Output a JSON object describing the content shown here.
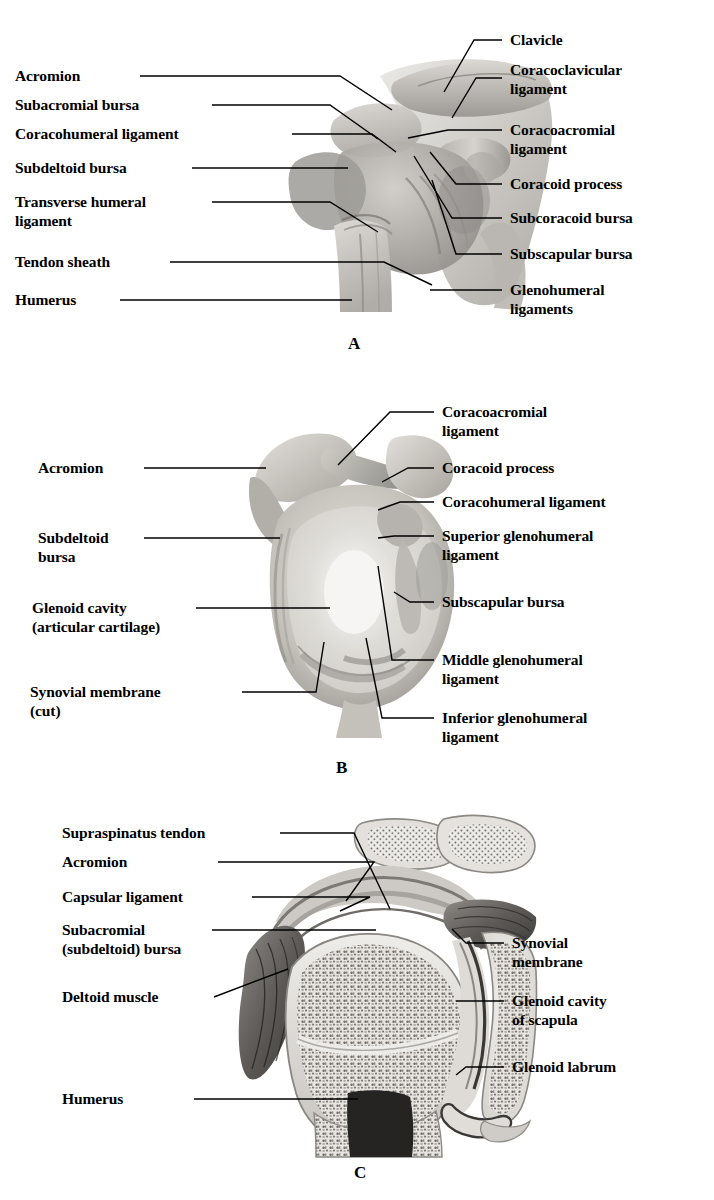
{
  "figure": {
    "background_color": "#ffffff",
    "line_color": "#000000",
    "text_color": "#000000"
  },
  "panels": [
    {
      "letter": "A",
      "view": "anterior view of the shoulder joint capsule and ligaments",
      "left_labels": [
        {
          "text": "Acromion"
        },
        {
          "text": "Subacromial bursa"
        },
        {
          "text": "Coracohumeral ligament"
        },
        {
          "text": "Subdeltoid bursa"
        },
        {
          "text": "Transverse humeral\nligament"
        },
        {
          "text": "Tendon sheath"
        },
        {
          "text": "Humerus"
        }
      ],
      "right_labels": [
        {
          "text": "Clavicle"
        },
        {
          "text": "Coracoclavicular\nligament"
        },
        {
          "text": "Coracoacromial\nligament"
        },
        {
          "text": "Coracoid process"
        },
        {
          "text": "Subcoracoid bursa"
        },
        {
          "text": "Subscapular bursa"
        },
        {
          "text": "Glenohumeral\nligaments"
        }
      ]
    },
    {
      "letter": "B",
      "view": "lateral view with humerus removed showing glenoid cavity",
      "left_labels": [
        {
          "text": "Acromion"
        },
        {
          "text": "Subdeltoid\nbursa"
        },
        {
          "text": "Glenoid cavity\n(articular cartilage)"
        },
        {
          "text": "Synovial membrane\n(cut)"
        }
      ],
      "right_labels": [
        {
          "text": "Coracoacromial\nligament"
        },
        {
          "text": "Coracoid process"
        },
        {
          "text": "Coracohumeral ligament"
        },
        {
          "text": "Superior glenohumeral\nligament"
        },
        {
          "text": "Subscapular bursa"
        },
        {
          "text": "Middle glenohumeral\nligament"
        },
        {
          "text": "Inferior glenohumeral\nligament"
        }
      ]
    },
    {
      "letter": "C",
      "view": "frontal (coronal) section through the shoulder joint",
      "left_labels": [
        {
          "text": "Supraspinatus tendon"
        },
        {
          "text": "Acromion"
        },
        {
          "text": "Capsular ligament"
        },
        {
          "text": "Subacromial\n(subdeltoid) bursa"
        },
        {
          "text": "Deltoid muscle"
        },
        {
          "text": "Humerus"
        }
      ],
      "right_labels": [
        {
          "text": "Synovial\nmembrane"
        },
        {
          "text": "Glenoid cavity\nof scapula"
        },
        {
          "text": "Glenoid labrum"
        }
      ]
    }
  ]
}
